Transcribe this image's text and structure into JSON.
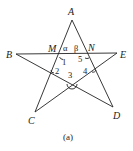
{
  "figure": {
    "caption": "(a)",
    "stroke_color": "#222222",
    "background": "#ffffff",
    "vertices": {
      "A": {
        "label": "A",
        "x": 72,
        "y": 20
      },
      "B": {
        "label": "B",
        "x": 16,
        "y": 54
      },
      "C": {
        "label": "C",
        "x": 35,
        "y": 112
      },
      "D": {
        "label": "D",
        "x": 113,
        "y": 107
      },
      "E": {
        "label": "E",
        "x": 117,
        "y": 53
      }
    },
    "intersections": {
      "M": {
        "label": "M",
        "x": 62,
        "y": 54
      },
      "N": {
        "label": "N",
        "x": 83,
        "y": 54
      }
    },
    "segments": [
      "A-C",
      "A-D",
      "B-E",
      "B-D",
      "E-C"
    ],
    "angle_labels": {
      "alpha": "α",
      "beta": "β",
      "a1": "1",
      "a2": "2",
      "a3": "3",
      "a4": "4",
      "a5": "5"
    }
  }
}
